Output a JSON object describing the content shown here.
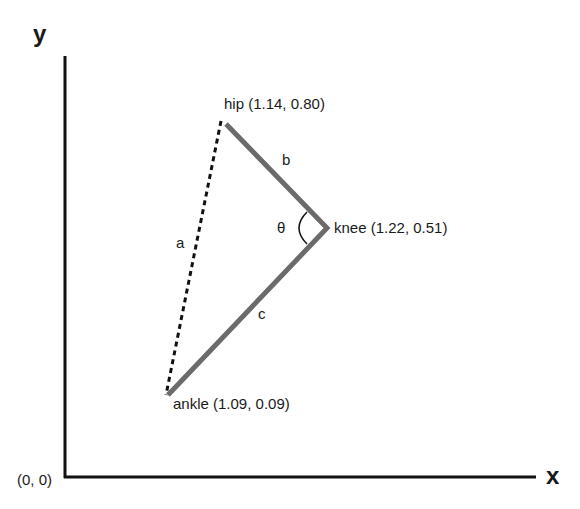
{
  "axes": {
    "x_label": "x",
    "y_label": "y",
    "origin_label": "(0, 0)"
  },
  "points": {
    "hip": {
      "label": "hip (1.14, 0.80)",
      "x": 1.14,
      "y": 0.8
    },
    "knee": {
      "label": "knee (1.22, 0.51)",
      "x": 1.22,
      "y": 0.51
    },
    "ankle": {
      "label": "ankle (1.09, 0.09)",
      "x": 1.09,
      "y": 0.09
    }
  },
  "segments": {
    "a": {
      "label": "a",
      "from": "hip",
      "to": "ankle",
      "style": "dashed"
    },
    "b": {
      "label": "b",
      "from": "hip",
      "to": "knee",
      "style": "solid"
    },
    "c": {
      "label": "c",
      "from": "knee",
      "to": "ankle",
      "style": "solid"
    }
  },
  "angle": {
    "label": "θ",
    "at": "knee"
  },
  "colors": {
    "segment": "#6b6b6b",
    "axis": "#111111",
    "dashed": "#111111"
  }
}
